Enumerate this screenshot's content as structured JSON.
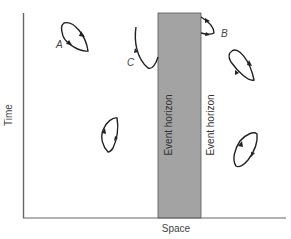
{
  "diagram": {
    "type": "spacetime-diagram",
    "axes": {
      "x_label": "Space",
      "y_label": "Time"
    },
    "black_hole_region": {
      "fill_color": "#a3a3a3",
      "left_label": "Event horizon",
      "right_label": "Event horizon"
    },
    "labels": {
      "A": "A",
      "B": "B",
      "C": "C"
    },
    "colors": {
      "axis": "#666666",
      "curve": "#222222",
      "band": "#a3a3a3"
    }
  }
}
